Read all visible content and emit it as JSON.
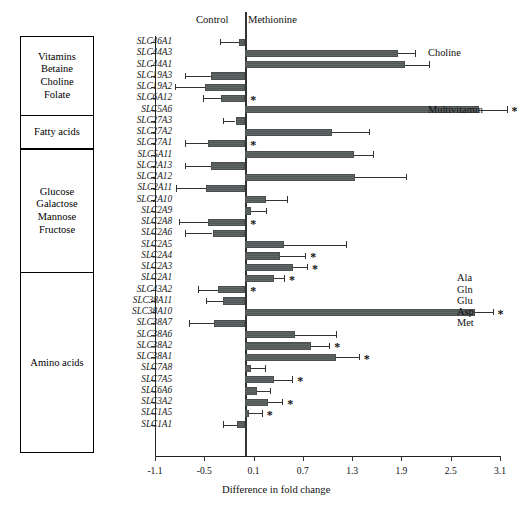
{
  "figure": {
    "x_axis_title": "Difference in fold change",
    "header_left": "Control",
    "header_right": "Methionine"
  },
  "categories": [
    {
      "id": "vitamins",
      "lines": [
        "Vitamins",
        "Betaine",
        "Choline",
        "Folate"
      ],
      "start_row": 0,
      "end_row": 6
    },
    {
      "id": "fatty-acids",
      "lines": [
        "Fatty acids"
      ],
      "start_row": 7,
      "end_row": 9
    },
    {
      "id": "sugars",
      "lines": [
        "Glucose",
        "Galactose",
        "Mannose",
        "Fructose"
      ],
      "start_row": 10,
      "end_row": 20
    },
    {
      "id": "amino-acids",
      "lines": [
        "Amino acids"
      ],
      "start_row": 21,
      "end_row": 36
    }
  ],
  "right_annotations": [
    {
      "label": "Choline",
      "row": 1
    },
    {
      "label": "Multivitamin",
      "row": 6
    },
    {
      "label": "Ala",
      "row": 21
    },
    {
      "label": "Gln",
      "row": 22
    },
    {
      "label": "Glu",
      "row": 23
    },
    {
      "label": "Asp",
      "row": 24
    },
    {
      "label": "Met",
      "row": 25
    }
  ],
  "chart_data": {
    "type": "bar",
    "orientation": "horizontal",
    "title": "",
    "xlabel": "Difference in fold change",
    "ylabel": "",
    "xlim": [
      -1.1,
      3.1
    ],
    "xticks": [
      -1.1,
      -0.5,
      0.1,
      0.7,
      1.3,
      1.9,
      2.5,
      3.1
    ],
    "xticklabels": [
      "-1.1",
      "-0.5",
      "0.1",
      "0.7",
      "1.3",
      "1.9",
      "2.5",
      "3.1"
    ],
    "grid": false,
    "legend": null,
    "zero_reference": 0.0,
    "significance_marker": "*",
    "categories": [
      "SLC46A1",
      "SLC44A3",
      "SLC44A1",
      "SLC19A3",
      "SLC19A2",
      "SLC6A12",
      "SLC5A6",
      "SLC27A3",
      "SLC27A2",
      "SLC27A1",
      "SLC5A11",
      "SLC2A13",
      "SLC2A12",
      "SLC2A11",
      "SLC2A10",
      "SLC2A9",
      "SLC2A8",
      "SLC2A6",
      "SLC2A5",
      "SLC2A4",
      "SLC2A3",
      "SLC2A1",
      "SLC43A2",
      "SLC38A11",
      "SLC38A10",
      "SLC38A7",
      "SLC38A6",
      "SLC38A2",
      "SLC38A1",
      "SLC7A8",
      "SLC7A5",
      "SLC6A6",
      "SLC3A2",
      "SLC1A5",
      "SLC1A1"
    ],
    "values": [
      -0.08,
      1.86,
      1.94,
      -0.42,
      -0.49,
      -0.3,
      2.85,
      -0.12,
      1.06,
      -0.45,
      1.32,
      -0.42,
      1.34,
      -0.48,
      0.25,
      0.07,
      -0.46,
      -0.4,
      0.47,
      0.42,
      0.58,
      0.35,
      -0.33,
      -0.27,
      2.8,
      -0.38,
      0.6,
      0.8,
      1.1,
      0.07,
      0.35,
      0.14,
      0.27,
      0.05,
      -0.1
    ],
    "errors_low": [
      0.23,
      0.0,
      0.0,
      0.31,
      0.37,
      0.21,
      0.0,
      0.15,
      0.0,
      0.28,
      0.0,
      0.32,
      0.0,
      0.36,
      0.0,
      0.0,
      0.35,
      0.33,
      0.0,
      0.0,
      0.0,
      0.0,
      0.25,
      0.21,
      0.0,
      0.31,
      0.0,
      0.0,
      0.0,
      0.0,
      0.0,
      0.0,
      0.0,
      0.0,
      0.17
    ],
    "errors_high": [
      0.0,
      0.21,
      0.3,
      0.0,
      0.0,
      0.0,
      0.33,
      0.0,
      0.44,
      0.0,
      0.23,
      0.0,
      0.61,
      0.0,
      0.26,
      0.18,
      0.0,
      0.0,
      0.75,
      0.31,
      0.17,
      0.12,
      0.0,
      0.0,
      0.21,
      0.0,
      0.5,
      0.22,
      0.28,
      0.17,
      0.22,
      0.16,
      0.18,
      0.15,
      0.0
    ],
    "significant": [
      false,
      false,
      false,
      false,
      false,
      true,
      true,
      false,
      false,
      true,
      false,
      false,
      false,
      false,
      false,
      false,
      true,
      false,
      false,
      true,
      true,
      true,
      true,
      false,
      true,
      false,
      false,
      true,
      true,
      false,
      true,
      false,
      true,
      true,
      false
    ]
  }
}
